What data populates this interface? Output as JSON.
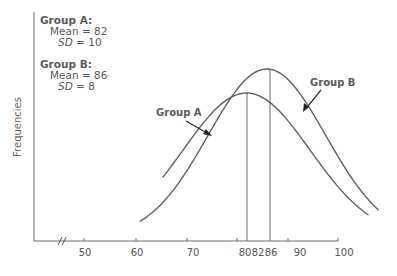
{
  "chart_data": {
    "type": "line",
    "title": "",
    "xlabel": "",
    "ylabel": "Frequencies",
    "x_ticks": [
      50,
      60,
      70,
      80,
      82,
      86,
      90,
      100
    ],
    "x_tick_labels": [
      "50",
      "60",
      "70",
      "80",
      "82",
      "86",
      "90",
      "100"
    ],
    "axis_break": "//",
    "xlim": [
      45,
      100
    ],
    "grid": false,
    "legend_position": "inline-annotations",
    "series": [
      {
        "name": "Group A",
        "distribution": "normal",
        "mean": 82,
        "sd": 10,
        "peak_marker_x": 82
      },
      {
        "name": "Group B",
        "distribution": "normal",
        "mean": 86,
        "sd": 8,
        "peak_marker_x": 86
      }
    ],
    "annotations": [
      {
        "text": "Group A",
        "points_to": "Group A curve (left flank)"
      },
      {
        "text": "Group B",
        "points_to": "Group B curve (right flank)"
      }
    ]
  },
  "stats_box": {
    "group_a": {
      "title": "Group A:",
      "mean_label": "Mean",
      "mean_value": "82",
      "sd_label": "SD",
      "sd_value": "10"
    },
    "group_b": {
      "title": "Group B:",
      "mean_label": "Mean",
      "mean_value": "86",
      "sd_label": "SD",
      "sd_value": "8"
    },
    "equals": "="
  },
  "colors": {
    "curve": "#5f5f5f",
    "axis": "#6a6a6a",
    "text": "#555555"
  }
}
